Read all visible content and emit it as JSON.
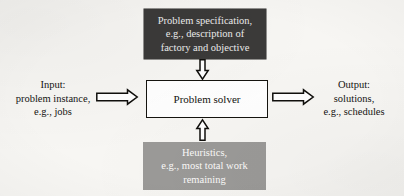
{
  "diagram": {
    "background_color": "#f7f6f3",
    "nodes": {
      "specification": {
        "name": "Problem specification",
        "fill_color": "#3b3a39",
        "text_color": "#ececec",
        "lines": [
          "Problem specification,",
          "e.g., description of",
          "factory and objective"
        ]
      },
      "solver": {
        "name": "Problem solver",
        "fill_color": "#ffffff",
        "border_color": "#15140f",
        "text_color": "#14130f",
        "label": "Problem solver"
      },
      "heuristics": {
        "name": "Heuristics",
        "fill_color": "#9b9a98",
        "text_color": "#fbfbfa",
        "lines": [
          "Heuristics,",
          "e.g., most total work",
          "remaining"
        ]
      }
    },
    "captions": {
      "input": {
        "lines": [
          "Input:",
          "problem instance,",
          "e.g., jobs"
        ]
      },
      "output": {
        "lines": [
          "Output:",
          "solutions,",
          "e.g., schedules"
        ]
      }
    },
    "arrows": {
      "input_to_solver": {
        "icon": "arrow-right-icon",
        "direction": "right"
      },
      "solver_to_output": {
        "icon": "arrow-right-icon",
        "direction": "right"
      },
      "specification_to_solver": {
        "icon": "arrow-down-icon",
        "direction": "down"
      },
      "heuristics_to_solver": {
        "icon": "arrow-up-icon",
        "direction": "up"
      }
    }
  }
}
